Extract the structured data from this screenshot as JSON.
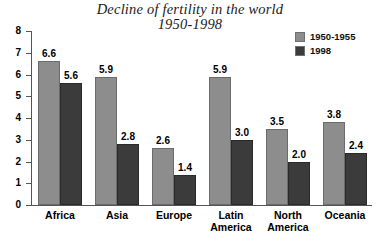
{
  "chart_data": {
    "type": "bar",
    "title": "Decline of fertility in the world 1950-1998",
    "title_line1": "Decline of fertility in the world",
    "title_line2": "1950-1998",
    "xlabel": "",
    "ylabel": "",
    "ylim": [
      0,
      8
    ],
    "ytick_labels": [
      "0",
      "1",
      "2",
      "3",
      "4",
      "5",
      "6",
      "7",
      "8"
    ],
    "yticks": [
      0,
      1,
      2,
      3,
      4,
      5,
      6,
      7,
      8
    ],
    "grid": false,
    "legend_position": "top-right",
    "categories": [
      "Africa",
      "Asia",
      "Europe",
      "Latin America",
      "North America",
      "Oceania"
    ],
    "category_lines": [
      [
        "Africa"
      ],
      [
        "Asia"
      ],
      [
        "Europe"
      ],
      [
        "Latin",
        "America"
      ],
      [
        "North",
        "America"
      ],
      [
        "Oceania"
      ]
    ],
    "series": [
      {
        "name": "1950-1955",
        "color": "#8d8d8d",
        "values": [
          6.6,
          5.9,
          2.6,
          5.9,
          3.5,
          3.8
        ],
        "labels": [
          "6.6",
          "5.9",
          "2.6",
          "5.9",
          "3.5",
          "3.8"
        ]
      },
      {
        "name": "1998",
        "color": "#3b3b3b",
        "values": [
          5.6,
          2.8,
          1.4,
          3.0,
          2.0,
          2.4
        ],
        "labels": [
          "5.6",
          "2.8",
          "1.4",
          "3.0",
          "2.0",
          "2.4"
        ]
      }
    ]
  }
}
